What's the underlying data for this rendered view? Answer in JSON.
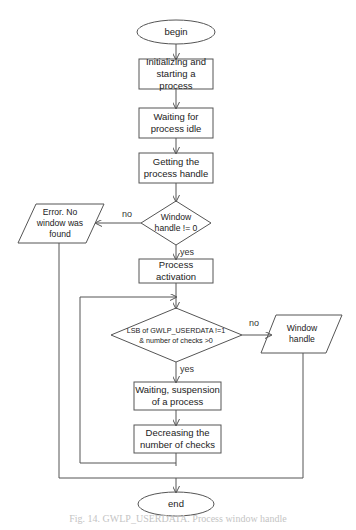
{
  "diagram": {
    "type": "flowchart",
    "nodes": {
      "begin": {
        "label": "begin",
        "shape": "ellipse"
      },
      "init": {
        "label": "Initializing and starting a process",
        "shape": "rect"
      },
      "wait_idle": {
        "label": "Waiting for process idle",
        "shape": "rect"
      },
      "get_handle": {
        "label": "Getting the process handle",
        "shape": "rect"
      },
      "check_window": {
        "label": "Window handle != 0",
        "shape": "diamond"
      },
      "error": {
        "label": "Error. No window was found",
        "shape": "parallelogram"
      },
      "activate": {
        "label": "Process activation",
        "shape": "rect"
      },
      "check_lsb": {
        "label": "LSB of GWLP_USERDATA !=1 & number of checks >0",
        "shape": "diamond"
      },
      "window_handle": {
        "label": "Window handle",
        "shape": "parallelogram"
      },
      "suspend": {
        "label": "Waiting, suspension of a process",
        "shape": "rect"
      },
      "decrease": {
        "label": "Decreasing the number of checks",
        "shape": "rect"
      },
      "end": {
        "label": "end",
        "shape": "ellipse"
      }
    },
    "edge_labels": {
      "check_window_no": "no",
      "check_window_yes": "yes",
      "check_lsb_no": "no",
      "check_lsb_yes": "yes"
    },
    "edges": [
      [
        "begin",
        "init"
      ],
      [
        "init",
        "wait_idle"
      ],
      [
        "wait_idle",
        "get_handle"
      ],
      [
        "get_handle",
        "check_window"
      ],
      [
        "check_window",
        "error",
        "no"
      ],
      [
        "check_window",
        "activate",
        "yes"
      ],
      [
        "activate",
        "check_lsb"
      ],
      [
        "check_lsb",
        "window_handle",
        "no"
      ],
      [
        "check_lsb",
        "suspend",
        "yes"
      ],
      [
        "suspend",
        "decrease"
      ],
      [
        "decrease",
        "check_lsb"
      ],
      [
        "error",
        "end"
      ],
      [
        "window_handle",
        "end"
      ]
    ],
    "caption": "Fig. 14. GWLP_USERDATA. Process window handle"
  }
}
